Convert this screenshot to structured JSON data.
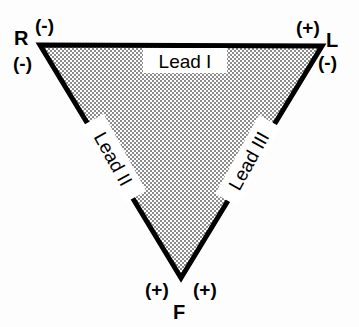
{
  "diagram": {
    "background_color": "#fdfdfd",
    "stroke_color": "#000000",
    "fill_pattern": "fine-checkerboard-stipple",
    "fill_color": "#b9b9b9",
    "stroke_width_px": 5
  },
  "vertices": [
    {
      "id": "R",
      "letter": "R",
      "name": "right-arm-electrode",
      "position": "top-left",
      "x": 40,
      "y": 45,
      "polarity_upper": "(-)",
      "polarity_lower": "(-)"
    },
    {
      "id": "L",
      "letter": "L",
      "name": "left-arm-electrode",
      "position": "top-right",
      "x": 322,
      "y": 46,
      "polarity_upper": "(+)",
      "polarity_lower": "(-)"
    },
    {
      "id": "F",
      "letter": "F",
      "name": "left-foot-electrode",
      "position": "bottom",
      "x": 181,
      "y": 278,
      "polarity_left": "(+)",
      "polarity_right": "(+)"
    }
  ],
  "leads": [
    {
      "id": "lead-1",
      "label": "Lead I",
      "edge": "top",
      "from": "R",
      "to": "L",
      "rotation_deg": 0
    },
    {
      "id": "lead-2",
      "label": "Lead II",
      "edge": "left",
      "from": "R",
      "to": "F",
      "rotation_deg": 61
    },
    {
      "id": "lead-3",
      "label": "Lead III",
      "edge": "right",
      "from": "L",
      "to": "F",
      "rotation_deg": -61
    }
  ]
}
